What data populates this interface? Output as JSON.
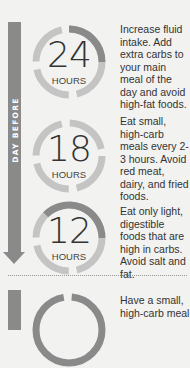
{
  "timeline": {
    "label": "DAY BEFORE",
    "colors": {
      "bar": "#8a8a8a",
      "ring_light": "#c4c4c4",
      "ring_dark": "#8a8a8a",
      "background": "#f2f2f0"
    }
  },
  "steps": [
    {
      "value": "24",
      "unit": "HOURS",
      "text": "Increase fluid intake. Add extra carbs to your main meal of the day and avoid high-fat foods."
    },
    {
      "value": "18",
      "unit": "HOURS",
      "text": "Eat small, high-carb meals every 2-3 hours. Avoid red meat, dairy, and fried foods."
    },
    {
      "value": "12",
      "unit": "HOURS",
      "text": "Eat only light, digestible foods that are high in carbs. Avoid salt and fat."
    },
    {
      "value": "",
      "unit": "",
      "text": "Have a small, high-carb meal"
    }
  ]
}
